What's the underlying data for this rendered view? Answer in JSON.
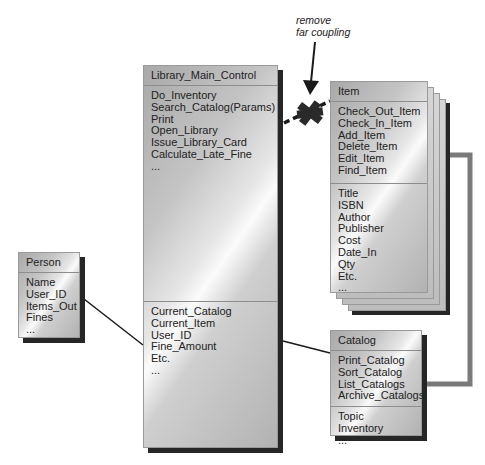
{
  "annotation": {
    "line1": "remove",
    "line2": "far coupling"
  },
  "classes": {
    "main": {
      "name": "Library_Main_Control",
      "methods": [
        "Do_Inventory",
        "Search_Catalog(Params)",
        "Print",
        "Open_Library",
        "Issue_Library_Card",
        "Calculate_Late_Fine",
        "..."
      ],
      "attributes": [
        "Current_Catalog",
        "Current_Item",
        "User_ID",
        "Fine_Amount",
        "Etc.",
        "..."
      ]
    },
    "item": {
      "name": "Item",
      "methods": [
        "Check_Out_Item",
        "Check_In_Item",
        "Add_Item",
        "Delete_Item",
        "Edit_Item",
        "Find_Item"
      ],
      "attributes": [
        "Title",
        "ISBN",
        "Author",
        "Publisher",
        "Cost",
        "Date_In",
        "Qty",
        "Etc.",
        "..."
      ]
    },
    "person": {
      "name": "Person",
      "attributes": [
        "Name",
        "User_ID",
        "Items_Out",
        "Fines",
        "..."
      ]
    },
    "catalog": {
      "name": "Catalog",
      "methods": [
        "Print_Catalog",
        "Sort_Catalog",
        "List_Catalogs",
        "Archive_Catalogs"
      ],
      "attributes": [
        "Topic",
        "Inventory",
        "..."
      ]
    }
  },
  "colors": {
    "shadow": "#262626",
    "arrow": "#7a7a7a",
    "connector": "#1a1a1a"
  }
}
